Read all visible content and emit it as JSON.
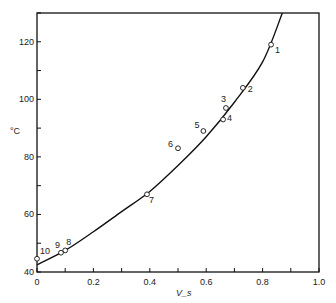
{
  "chart_data": {
    "type": "scatter",
    "title": "",
    "xlabel": "V_s",
    "ylabel": "°C",
    "xlim": [
      0,
      1.0
    ],
    "ylim": [
      40,
      130
    ],
    "grid": false,
    "legend": "none",
    "x_ticks": [
      "0",
      "0.2",
      "0.4",
      "0.6",
      "0.8",
      "1.0"
    ],
    "y_ticks": [
      "40",
      "60",
      "80",
      "100",
      "120"
    ],
    "series": [
      {
        "name": "data points",
        "marker": "open-circle",
        "points": [
          {
            "label": "1",
            "x": 0.83,
            "y": 119
          },
          {
            "label": "2",
            "x": 0.73,
            "y": 104
          },
          {
            "label": "3",
            "x": 0.67,
            "y": 97
          },
          {
            "label": "4",
            "x": 0.66,
            "y": 93
          },
          {
            "label": "5",
            "x": 0.59,
            "y": 89
          },
          {
            "label": "6",
            "x": 0.5,
            "y": 83
          },
          {
            "label": "7",
            "x": 0.39,
            "y": 67
          },
          {
            "label": "8",
            "x": 0.1,
            "y": 47.5
          },
          {
            "label": "9",
            "x": 0.085,
            "y": 46.7
          },
          {
            "label": "10",
            "x": 0.0,
            "y": 44.6
          }
        ]
      },
      {
        "name": "fitted curve",
        "type": "line",
        "x": [
          0.0,
          0.1,
          0.2,
          0.3,
          0.4,
          0.5,
          0.6,
          0.7,
          0.8,
          0.87
        ],
        "y": [
          42.5,
          47.5,
          54,
          61,
          68,
          77,
          87,
          99,
          113,
          130
        ]
      }
    ]
  }
}
